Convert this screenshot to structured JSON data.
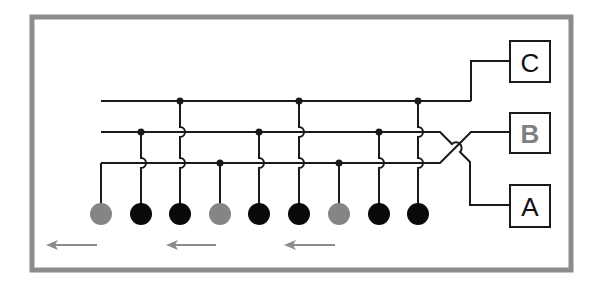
{
  "diagram": {
    "frame": {
      "x": 32,
      "y": 17,
      "width": 539,
      "height": 253,
      "stroke": "#8c8c8c",
      "stroke_width": 5
    },
    "colors": {
      "wire": "#1a1a1a",
      "black_node": "#0a0a0a",
      "gray_node": "#858585",
      "arrow": "#8c8c8c",
      "box_label_dark": "#111111",
      "box_label_gray": "#7f7f7f"
    },
    "buses": [
      {
        "id": "bus-c",
        "y": 101,
        "x_start": 101,
        "x_end": 471
      },
      {
        "id": "bus-b",
        "y": 132,
        "x_start": 101,
        "x_end": 430
      },
      {
        "id": "bus-a",
        "y": 163,
        "x_start": 101,
        "x_end": 430
      }
    ],
    "nodes": [
      {
        "x": 101,
        "color": "gray",
        "bus": "a"
      },
      {
        "x": 141,
        "color": "black",
        "bus": "b"
      },
      {
        "x": 180,
        "color": "black",
        "bus": "c"
      },
      {
        "x": 220,
        "color": "gray",
        "bus": "a"
      },
      {
        "x": 259,
        "color": "black",
        "bus": "b"
      },
      {
        "x": 299,
        "color": "black",
        "bus": "c"
      },
      {
        "x": 339,
        "color": "gray",
        "bus": "a"
      },
      {
        "x": 379,
        "color": "black",
        "bus": "b"
      },
      {
        "x": 418,
        "color": "black",
        "bus": "c"
      }
    ],
    "node_y": 214,
    "node_radius": 11,
    "boxes": [
      {
        "label": "C",
        "x": 510,
        "y": 41,
        "w": 40,
        "h": 41,
        "label_color": "dark"
      },
      {
        "label": "B",
        "x": 510,
        "y": 113,
        "w": 40,
        "h": 40,
        "label_color": "gray"
      },
      {
        "label": "A",
        "x": 510,
        "y": 185,
        "w": 40,
        "h": 42,
        "label_color": "dark"
      }
    ],
    "arrows": [
      {
        "x_tip": 46,
        "x_tail": 97,
        "y": 245,
        "direction": "left"
      },
      {
        "x_tip": 166,
        "x_tail": 216,
        "y": 245,
        "direction": "left"
      },
      {
        "x_tip": 284,
        "x_tail": 335,
        "y": 245,
        "direction": "left"
      }
    ]
  }
}
